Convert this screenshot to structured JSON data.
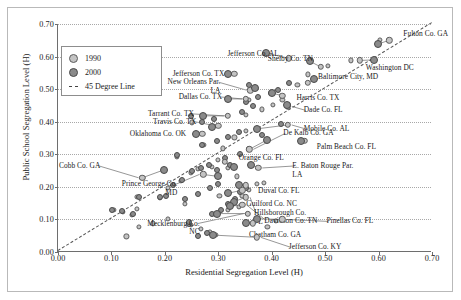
{
  "axes": {
    "xlabel": "Residential Segregation Level (H)",
    "ylabel": "Public School Segregation Level (H)",
    "xticks": [
      "0.00",
      "0.10",
      "0.20",
      "0.30",
      "0.40",
      "0.50",
      "0.60",
      "0.70"
    ],
    "yticks": [
      "0.00",
      "0.10",
      "0.20",
      "0.30",
      "0.40",
      "0.50",
      "0.60",
      "0.70"
    ]
  },
  "legend": {
    "item_1990": "1990",
    "item_2000": "2000",
    "item_line": "45 Degree Line"
  },
  "colors": {
    "point_1990": "#c3c3c3",
    "point_2000": "#8a8a8a",
    "axis": "#6e6e6e",
    "grid": "#a8a8a8",
    "diagonal": "#555555"
  },
  "chart_data": {
    "type": "scatter",
    "title": "",
    "xlabel": "Residential Segregation Level (H)",
    "ylabel": "Public School Segregation Level (H)",
    "xlim": [
      0.0,
      0.7
    ],
    "ylim": [
      0.0,
      0.7
    ],
    "grid": true,
    "legend_position": "upper-left",
    "reference_line": {
      "name": "45 Degree Line",
      "slope": 1,
      "intercept": 0,
      "style": "dashed"
    },
    "series": [
      {
        "name": "1990",
        "marker": "light-gray circle"
      },
      {
        "name": "2000",
        "marker": "dark-gray circle"
      }
    ],
    "labeled_counties": [
      {
        "label": "Fulton Co. GA",
        "x_1990": 0.62,
        "y_1990": 0.65,
        "x_2000": 0.598,
        "y_2000": 0.638
      },
      {
        "label": "Jefferson Co. AL",
        "x_1990": 0.432,
        "y_1990": 0.595,
        "x_2000": 0.39,
        "y_2000": 0.61
      },
      {
        "label": "Shelby Co. TN",
        "x_1990": 0.492,
        "y_1990": 0.568,
        "x_2000": 0.472,
        "y_2000": 0.585
      },
      {
        "label": "Washington DC",
        "x_1990": 0.565,
        "y_1990": 0.588,
        "x_2000": 0.592,
        "y_2000": 0.59
      },
      {
        "label": "Jefferson Co. TX",
        "x_1990": 0.33,
        "y_1990": 0.548,
        "x_2000": 0.318,
        "y_2000": 0.548
      },
      {
        "label": "Baltimore City, MD",
        "x_1990": 0.468,
        "y_1990": 0.52,
        "x_2000": 0.48,
        "y_2000": 0.532
      },
      {
        "label": "New Orleans Par. LA",
        "x_1990": 0.36,
        "y_1990": 0.497,
        "x_2000": 0.368,
        "y_2000": 0.505
      },
      {
        "label": "Dallas Co. TX",
        "x_1990": 0.352,
        "y_1990": 0.47,
        "x_2000": 0.318,
        "y_2000": 0.47
      },
      {
        "label": "Harris Co. TX",
        "x_1990": 0.42,
        "y_1990": 0.48,
        "x_2000": 0.4,
        "y_2000": 0.488
      },
      {
        "label": "Dade Co. FL",
        "x_1990": 0.43,
        "y_1990": 0.447,
        "x_2000": 0.428,
        "y_2000": 0.45
      },
      {
        "label": "Tarrant Co. TX",
        "x_1990": 0.318,
        "y_1990": 0.418,
        "x_2000": 0.272,
        "y_2000": 0.418
      },
      {
        "label": "Mobile Co. AL",
        "x_1990": 0.43,
        "y_1990": 0.39,
        "x_2000": 0.372,
        "y_2000": 0.378
      },
      {
        "label": "Travis Co. TX",
        "x_1990": 0.3,
        "y_1990": 0.388,
        "x_2000": 0.288,
        "y_2000": 0.385
      },
      {
        "label": "Oklahoma Co. OK",
        "x_1990": 0.27,
        "y_1990": 0.363,
        "x_2000": 0.258,
        "y_2000": 0.362
      },
      {
        "label": "Palm Beach Co. FL",
        "x_1990": 0.462,
        "y_1990": 0.342,
        "x_2000": 0.455,
        "y_2000": 0.34
      },
      {
        "label": "De Kalb Co. GA",
        "x_1990": 0.358,
        "y_1990": 0.315,
        "x_2000": 0.392,
        "y_2000": 0.345
      },
      {
        "label": "Cobb Co. GA",
        "x_1990": 0.158,
        "y_1990": 0.228,
        "x_2000": 0.198,
        "y_2000": 0.252
      },
      {
        "label": "Orange Co. FL",
        "x_1990": 0.312,
        "y_1990": 0.276,
        "x_2000": 0.33,
        "y_2000": 0.262
      },
      {
        "label": "E. Baton Rouge Par. LA",
        "x_1990": 0.375,
        "y_1990": 0.258,
        "x_2000": 0.362,
        "y_2000": 0.268
      },
      {
        "label": "Prince George Co. MD",
        "x_1990": 0.272,
        "y_1990": 0.238,
        "x_2000": 0.3,
        "y_2000": 0.232
      },
      {
        "label": "Duval Co. FL",
        "x_1990": 0.352,
        "y_1990": 0.205,
        "x_2000": 0.338,
        "y_2000": 0.205
      },
      {
        "label": "Guilford Co. NC",
        "x_1990": 0.345,
        "y_1990": 0.19,
        "x_2000": 0.318,
        "y_2000": 0.18
      },
      {
        "label": "Hillsborough Co. FL",
        "x_1990": 0.352,
        "y_1990": 0.168,
        "x_2000": 0.33,
        "y_2000": 0.155
      },
      {
        "label": "Davidson Co. TN",
        "x_1990": 0.345,
        "y_1990": 0.145,
        "x_2000": 0.322,
        "y_2000": 0.14
      },
      {
        "label": "Mecklenburg Co. NC",
        "x_1990": 0.355,
        "y_1990": 0.118,
        "x_2000": 0.298,
        "y_2000": 0.118
      },
      {
        "label": "Pinellas Co. FL",
        "x_1990": 0.42,
        "y_1990": 0.1,
        "x_2000": 0.372,
        "y_2000": 0.102
      },
      {
        "label": "Chatham Co. GA",
        "x_1990": 0.365,
        "y_1990": 0.088,
        "x_2000": 0.352,
        "y_2000": 0.09
      },
      {
        "label": "Jefferson Co. KY",
        "x_1990": 0.372,
        "y_1990": 0.045,
        "x_2000": 0.29,
        "y_2000": 0.052
      }
    ],
    "unlabeled_points_1990": [
      [
        0.105,
        0.128
      ],
      [
        0.122,
        0.122
      ],
      [
        0.138,
        0.115
      ],
      [
        0.148,
        0.132
      ],
      [
        0.152,
        0.078
      ],
      [
        0.148,
        0.17
      ],
      [
        0.158,
        0.228
      ],
      [
        0.128,
        0.048
      ],
      [
        0.19,
        0.165
      ],
      [
        0.205,
        0.198
      ],
      [
        0.23,
        0.218
      ],
      [
        0.248,
        0.242
      ],
      [
        0.262,
        0.255
      ],
      [
        0.288,
        0.262
      ],
      [
        0.3,
        0.282
      ],
      [
        0.318,
        0.258
      ],
      [
        0.335,
        0.232
      ],
      [
        0.285,
        0.06
      ],
      [
        0.295,
        0.052
      ],
      [
        0.248,
        0.082
      ],
      [
        0.268,
        0.072
      ],
      [
        0.318,
        0.128
      ],
      [
        0.338,
        0.138
      ],
      [
        0.302,
        0.172
      ],
      [
        0.345,
        0.172
      ],
      [
        0.358,
        0.19
      ],
      [
        0.372,
        0.208
      ],
      [
        0.385,
        0.212
      ],
      [
        0.308,
        0.318
      ],
      [
        0.272,
        0.33
      ],
      [
        0.33,
        0.352
      ],
      [
        0.352,
        0.372
      ],
      [
        0.25,
        0.398
      ],
      [
        0.272,
        0.418
      ],
      [
        0.352,
        0.422
      ],
      [
        0.382,
        0.438
      ],
      [
        0.402,
        0.452
      ],
      [
        0.358,
        0.468
      ],
      [
        0.42,
        0.468
      ],
      [
        0.448,
        0.512
      ],
      [
        0.468,
        0.545
      ],
      [
        0.505,
        0.572
      ],
      [
        0.548,
        0.588
      ],
      [
        0.602,
        0.65
      ],
      [
        0.222,
        0.292
      ],
      [
        0.238,
        0.148
      ],
      [
        0.205,
        0.102
      ],
      [
        0.178,
        0.088
      ],
      [
        0.408,
        0.095
      ],
      [
        0.392,
        0.078
      ]
    ],
    "unlabeled_points_2000": [
      [
        0.102,
        0.13
      ],
      [
        0.12,
        0.125
      ],
      [
        0.14,
        0.118
      ],
      [
        0.152,
        0.17
      ],
      [
        0.19,
        0.168
      ],
      [
        0.198,
        0.252
      ],
      [
        0.215,
        0.205
      ],
      [
        0.232,
        0.222
      ],
      [
        0.25,
        0.248
      ],
      [
        0.268,
        0.258
      ],
      [
        0.282,
        0.268
      ],
      [
        0.298,
        0.252
      ],
      [
        0.312,
        0.288
      ],
      [
        0.322,
        0.268
      ],
      [
        0.245,
        0.085
      ],
      [
        0.245,
        0.092
      ],
      [
        0.288,
        0.118
      ],
      [
        0.305,
        0.13
      ],
      [
        0.318,
        0.148
      ],
      [
        0.332,
        0.162
      ],
      [
        0.34,
        0.185
      ],
      [
        0.352,
        0.198
      ],
      [
        0.3,
        0.208
      ],
      [
        0.285,
        0.195
      ],
      [
        0.262,
        0.178
      ],
      [
        0.238,
        0.162
      ],
      [
        0.27,
        0.33
      ],
      [
        0.298,
        0.342
      ],
      [
        0.318,
        0.352
      ],
      [
        0.338,
        0.368
      ],
      [
        0.27,
        0.398
      ],
      [
        0.292,
        0.408
      ],
      [
        0.248,
        0.418
      ],
      [
        0.345,
        0.43
      ],
      [
        0.365,
        0.448
      ],
      [
        0.352,
        0.462
      ],
      [
        0.375,
        0.475
      ],
      [
        0.398,
        0.488
      ],
      [
        0.412,
        0.498
      ],
      [
        0.432,
        0.52
      ],
      [
        0.358,
        0.512
      ],
      [
        0.43,
        0.452
      ],
      [
        0.34,
        0.302
      ],
      [
        0.358,
        0.315
      ],
      [
        0.202,
        0.172
      ],
      [
        0.382,
        0.358
      ],
      [
        0.418,
        0.392
      ],
      [
        0.262,
        0.048
      ],
      [
        0.278,
        0.058
      ],
      [
        0.222,
        0.298
      ]
    ]
  }
}
